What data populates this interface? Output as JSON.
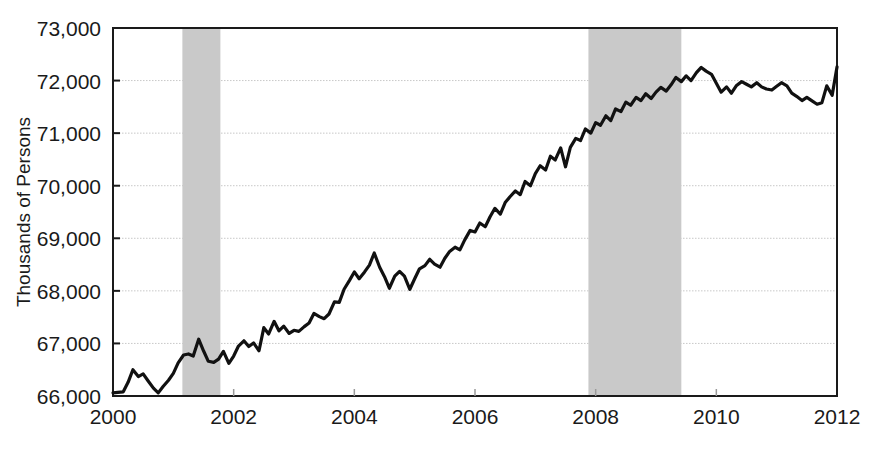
{
  "chart_data": {
    "type": "line",
    "title": "",
    "subtitle": "",
    "xlabel": "",
    "ylabel": "Thousands of Persons",
    "xlim": [
      2000,
      2012
    ],
    "ylim": [
      66000,
      73000
    ],
    "xticks": [
      2000,
      2002,
      2004,
      2006,
      2008,
      2010,
      2012
    ],
    "xtick_labels": [
      "2000",
      "2002",
      "2004",
      "2006",
      "2008",
      "2010",
      "2012"
    ],
    "yticks": [
      66000,
      67000,
      68000,
      69000,
      70000,
      71000,
      72000,
      73000
    ],
    "ytick_labels": [
      "66,000",
      "67,000",
      "68,000",
      "69,000",
      "70,000",
      "71,000",
      "72,000",
      "73,000"
    ],
    "grid": true,
    "grid_axis": "y",
    "grid_color": "#c8c8c8",
    "legend": null,
    "line_color": "#111111",
    "line_width": 3.2,
    "shaded_band_color": "#c9c9c9",
    "shaded_bands": [
      {
        "label": "recession",
        "x_start": 2001.15,
        "x_end": 2001.78
      },
      {
        "label": "recession",
        "x_start": 2007.88,
        "x_end": 2009.42
      }
    ],
    "series": [
      {
        "name": "Employment",
        "x": [
          2000.0,
          2000.08,
          2000.17,
          2000.25,
          2000.33,
          2000.42,
          2000.5,
          2000.58,
          2000.67,
          2000.75,
          2000.83,
          2000.92,
          2001.0,
          2001.08,
          2001.17,
          2001.25,
          2001.33,
          2001.42,
          2001.5,
          2001.58,
          2001.67,
          2001.75,
          2001.83,
          2001.92,
          2002.0,
          2002.08,
          2002.17,
          2002.25,
          2002.33,
          2002.42,
          2002.5,
          2002.58,
          2002.67,
          2002.75,
          2002.83,
          2002.92,
          2003.0,
          2003.08,
          2003.17,
          2003.25,
          2003.33,
          2003.42,
          2003.5,
          2003.58,
          2003.67,
          2003.75,
          2003.83,
          2003.92,
          2004.0,
          2004.08,
          2004.17,
          2004.25,
          2004.33,
          2004.42,
          2004.5,
          2004.58,
          2004.67,
          2004.75,
          2004.83,
          2004.92,
          2005.0,
          2005.08,
          2005.17,
          2005.25,
          2005.33,
          2005.42,
          2005.5,
          2005.58,
          2005.67,
          2005.75,
          2005.83,
          2005.92,
          2006.0,
          2006.08,
          2006.17,
          2006.25,
          2006.33,
          2006.42,
          2006.5,
          2006.58,
          2006.67,
          2006.75,
          2006.83,
          2006.92,
          2007.0,
          2007.08,
          2007.17,
          2007.25,
          2007.33,
          2007.42,
          2007.5,
          2007.58,
          2007.67,
          2007.75,
          2007.83,
          2007.92,
          2008.0,
          2008.08,
          2008.17,
          2008.25,
          2008.33,
          2008.42,
          2008.5,
          2008.58,
          2008.67,
          2008.75,
          2008.83,
          2008.92,
          2009.0,
          2009.08,
          2009.17,
          2009.25,
          2009.33,
          2009.42,
          2009.5,
          2009.58,
          2009.67,
          2009.75,
          2009.83,
          2009.92,
          2010.0,
          2010.08,
          2010.17,
          2010.25,
          2010.33,
          2010.42,
          2010.5,
          2010.58,
          2010.67,
          2010.75,
          2010.83,
          2010.92,
          2011.0,
          2011.08,
          2011.17,
          2011.25,
          2011.33,
          2011.42,
          2011.5,
          2011.58,
          2011.67,
          2011.75,
          2011.83,
          2011.92,
          2012.0
        ],
        "values": [
          66060,
          66070,
          66080,
          66260,
          66500,
          66370,
          66420,
          66290,
          66150,
          66060,
          66180,
          66300,
          66430,
          66630,
          66780,
          66800,
          66760,
          67080,
          66860,
          66660,
          66640,
          66700,
          66850,
          66620,
          66760,
          66950,
          67050,
          66940,
          67010,
          66860,
          67300,
          67180,
          67420,
          67240,
          67330,
          67190,
          67250,
          67230,
          67320,
          67390,
          67570,
          67510,
          67470,
          67560,
          67790,
          67780,
          68030,
          68200,
          68360,
          68230,
          68360,
          68490,
          68720,
          68450,
          68270,
          68050,
          68280,
          68370,
          68280,
          68030,
          68230,
          68420,
          68480,
          68600,
          68510,
          68450,
          68620,
          68750,
          68830,
          68780,
          68970,
          69150,
          69120,
          69290,
          69220,
          69410,
          69570,
          69460,
          69680,
          69790,
          69900,
          69830,
          70080,
          70000,
          70230,
          70380,
          70300,
          70560,
          70490,
          70720,
          70360,
          70730,
          70900,
          70860,
          71080,
          71000,
          71200,
          71150,
          71330,
          71240,
          71460,
          71410,
          71590,
          71530,
          71680,
          71620,
          71750,
          71660,
          71780,
          71870,
          71800,
          71920,
          72060,
          71980,
          72090,
          72000,
          72150,
          72250,
          72180,
          72120,
          71950,
          71780,
          71880,
          71760,
          71900,
          71980,
          71930,
          71880,
          71960,
          71880,
          71840,
          71820,
          71890,
          71960,
          71900,
          71760,
          71700,
          71620,
          71680,
          71620,
          71550,
          71580,
          71900,
          71720,
          72260
        ]
      }
    ]
  }
}
